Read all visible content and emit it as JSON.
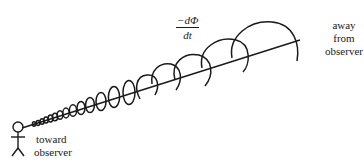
{
  "diagram": {
    "formula": {
      "numerator": "−dΦ",
      "denominator": "dt"
    },
    "labels": {
      "away": [
        "away",
        "from",
        "observer"
      ],
      "toward": [
        "toward",
        "observer"
      ]
    },
    "axis": {
      "x1": 22,
      "y1": 128,
      "x2": 300,
      "y2": 40
    },
    "loops": [
      {
        "cx": 36,
        "cy": 123,
        "r": 2
      },
      {
        "cx": 42,
        "cy": 121,
        "r": 2.5
      },
      {
        "cx": 48,
        "cy": 119,
        "r": 3
      },
      {
        "cx": 54,
        "cy": 117,
        "r": 3.5
      },
      {
        "cx": 61,
        "cy": 115,
        "r": 4
      },
      {
        "cx": 69,
        "cy": 112,
        "r": 5
      },
      {
        "cx": 78,
        "cy": 109,
        "r": 6
      },
      {
        "cx": 89,
        "cy": 106,
        "r": 7
      },
      {
        "cx": 102,
        "cy": 102,
        "r": 8.5
      },
      {
        "cx": 118,
        "cy": 97,
        "r": 10
      },
      {
        "cx": 137,
        "cy": 90,
        "r": 12
      },
      {
        "cx": 160,
        "cy": 83,
        "r": 14
      },
      {
        "cx": 187,
        "cy": 75,
        "r": 17
      },
      {
        "cx": 222,
        "cy": 62,
        "r": 22
      },
      {
        "cx": 262,
        "cy": 48,
        "r": 28
      }
    ],
    "colors": {
      "ink": "#1a1a1a",
      "background": "#ffffff"
    }
  }
}
